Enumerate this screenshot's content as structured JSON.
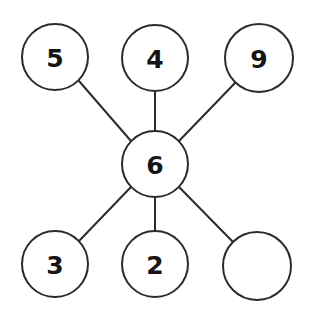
{
  "diagram": {
    "type": "star-graph",
    "canvas": {
      "width": 309,
      "height": 315,
      "background": "#ffffff"
    },
    "style": {
      "stroke_color": "#2b2b2b",
      "stroke_width": 2,
      "node_fill": "#ffffff",
      "label_color": "#151515",
      "node_radius": 33,
      "label_font_size": 25
    },
    "nodes": [
      {
        "id": "top-left",
        "label": "5",
        "cx": 55,
        "cy": 57,
        "r": 33,
        "empty": false
      },
      {
        "id": "top-center",
        "label": "4",
        "cx": 155,
        "cy": 58,
        "r": 33,
        "empty": false
      },
      {
        "id": "top-right",
        "label": "9",
        "cx": 259,
        "cy": 58,
        "r": 34,
        "empty": false
      },
      {
        "id": "center-hub",
        "label": "6",
        "cx": 155,
        "cy": 164,
        "r": 33,
        "empty": false
      },
      {
        "id": "bottom-left",
        "label": "3",
        "cx": 55,
        "cy": 264,
        "r": 33,
        "empty": false
      },
      {
        "id": "bottom-center",
        "label": "2",
        "cx": 155,
        "cy": 264,
        "r": 33,
        "empty": false
      },
      {
        "id": "bottom-right",
        "label": "",
        "cx": 257,
        "cy": 266,
        "r": 34,
        "empty": true
      }
    ],
    "edges": [
      {
        "id": "edge-hub-top-left",
        "from": "center-hub",
        "to": "top-left",
        "x1": 131,
        "y1": 141,
        "x2": 79,
        "y2": 81
      },
      {
        "id": "edge-hub-top-center",
        "from": "center-hub",
        "to": "top-center",
        "x1": 155,
        "y1": 131,
        "x2": 155,
        "y2": 91
      },
      {
        "id": "edge-hub-top-right",
        "from": "center-hub",
        "to": "top-right",
        "x1": 179,
        "y1": 141,
        "x2": 235,
        "y2": 83
      },
      {
        "id": "edge-hub-bottom-left",
        "from": "center-hub",
        "to": "bottom-left",
        "x1": 131,
        "y1": 187,
        "x2": 79,
        "y2": 241
      },
      {
        "id": "edge-hub-bottom-center",
        "from": "center-hub",
        "to": "bottom-center",
        "x1": 155,
        "y1": 197,
        "x2": 155,
        "y2": 231
      },
      {
        "id": "edge-hub-bottom-right",
        "from": "center-hub",
        "to": "bottom-right",
        "x1": 179,
        "y1": 187,
        "x2": 234,
        "y2": 243
      }
    ]
  }
}
